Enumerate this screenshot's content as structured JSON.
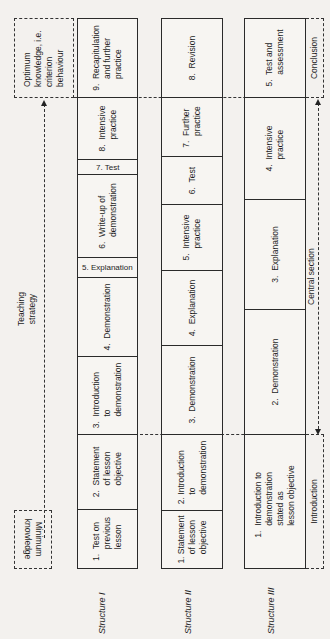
{
  "diagram": {
    "title": "Teaching strategy",
    "start_label": "Minimum knowledge",
    "end_label": "Optimum knowledge, i.e. criterion behaviour",
    "sections": {
      "introduction": "Introduction",
      "central": "Central section",
      "conclusion": "Conclusion"
    },
    "structures": [
      {
        "name": "Structure I",
        "steps": [
          "1.  Test on\n     previous\n     lesson",
          "2.  Statement\n     of lesson\n     objective",
          "3.  Introduction\n     to\n     demonstration",
          "4.  Demonstration",
          "5. Explanation",
          "6.  Write-up of\n     demonstration",
          "7. Test",
          "8.  Intensive\n     practice",
          "9.  Recapitulation\n     and further\n     practice"
        ]
      },
      {
        "name": "Structure II",
        "steps": [
          "1. Statement\n    of lesson\n    objective",
          "2. Introduction\n    to\n    demonstration",
          "3.  Demonstration",
          "4.  Explanation",
          "5.  Intensive\n     practice",
          "6.  Test",
          "7.  Further\n     practice",
          "8.  Revision"
        ]
      },
      {
        "name": "Structure III",
        "steps": [
          "1.  Introduction to\n     demonstration\n     stated as\n     lesson objective",
          "2.  Demonstration",
          "3.  Explanation",
          "4.  Intensive\n     practice",
          "5.  Test and\n     assessment"
        ]
      }
    ]
  }
}
